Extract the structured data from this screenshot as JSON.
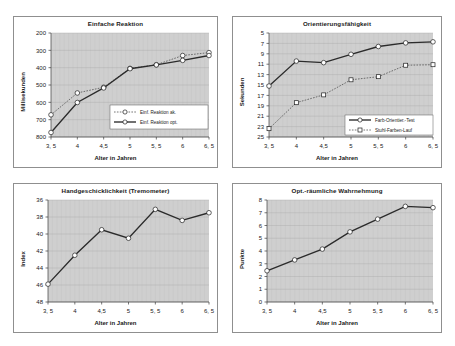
{
  "page": {
    "background_color": "#ffffff",
    "frame_color": "#8f8f8f",
    "plot_background_color": "#cfcfcf"
  },
  "shared": {
    "xlabel": "Alter in Jahren",
    "x_tick_labels": [
      "3, 5",
      "4",
      "4,5",
      "5",
      "5, 5",
      "6",
      "6, 5"
    ],
    "x_values": [
      3.5,
      4,
      4.5,
      5,
      5.5,
      6,
      6.5
    ]
  },
  "chart_data": [
    {
      "id": "einfache-reaktion",
      "type": "line",
      "title": "Einfache Reaktion",
      "xlabel": "Alter in Jahren",
      "ylabel": "Millisekunden",
      "x": [
        3.5,
        4,
        4.5,
        5,
        5.5,
        6,
        6.5
      ],
      "x_tick_labels": [
        "3, 5",
        "4",
        "4,5",
        "5",
        "5, 5",
        "6",
        "6, 5"
      ],
      "y_ticks": [
        200,
        300,
        400,
        500,
        600,
        700,
        800
      ],
      "ylim": [
        200,
        800
      ],
      "y_inverted": true,
      "grid": true,
      "legend_position": "lower right",
      "series": [
        {
          "name": "Einf. Reaktion ak.",
          "style": "dashed",
          "marker": "circle",
          "values": [
            672,
            546,
            513,
            404,
            383,
            330,
            313
          ]
        },
        {
          "name": "Einf. Reaktion opt.",
          "style": "solid",
          "marker": "circle",
          "values": [
            774,
            601,
            517,
            406,
            384,
            358,
            330
          ]
        }
      ]
    },
    {
      "id": "orientierungsfaehigkeit",
      "type": "line",
      "title": "Orientierungsfähigkeit",
      "xlabel": "Alter in Jahren",
      "ylabel": "Sekunden",
      "x": [
        3.5,
        4,
        4.5,
        5,
        5.5,
        6,
        6.5
      ],
      "x_tick_labels": [
        "3, 5",
        "4",
        "4,5",
        "5",
        "5, 5",
        "6",
        "6, 5"
      ],
      "y_ticks": [
        5,
        7,
        9,
        11,
        13,
        15,
        17,
        19,
        21,
        23,
        25
      ],
      "ylim": [
        5,
        25
      ],
      "y_inverted": true,
      "grid": true,
      "legend_position": "lower right",
      "series": [
        {
          "name": "Farb-Orientier.-Test",
          "style": "solid",
          "marker": "circle",
          "values": [
            15.2,
            10.4,
            10.7,
            9.1,
            7.6,
            6.9,
            6.7
          ]
        },
        {
          "name": "Stuhl-Farben-Lauf",
          "style": "dashed",
          "marker": "square",
          "values": [
            23.4,
            18.4,
            16.9,
            14.0,
            13.4,
            11.2,
            11.1
          ]
        }
      ]
    },
    {
      "id": "handgeschicklichkeit",
      "type": "line",
      "title": "Handgeschicklichkeit (Tremometer)",
      "xlabel": "Alter in Jahren",
      "ylabel": "Index",
      "x": [
        3.5,
        4,
        4.5,
        5,
        5.5,
        6,
        6.5
      ],
      "x_tick_labels": [
        "3, 5",
        "4",
        "4,5",
        "5",
        "5, 5",
        "6",
        "6, 5"
      ],
      "y_ticks": [
        36,
        38,
        40,
        42,
        44,
        46,
        48
      ],
      "ylim": [
        36,
        48
      ],
      "y_inverted": true,
      "grid": true,
      "legend_position": "none",
      "series": [
        {
          "name": "Index",
          "style": "solid",
          "marker": "circle",
          "values": [
            45.9,
            42.5,
            39.5,
            40.5,
            37.1,
            38.4,
            37.5
          ]
        }
      ]
    },
    {
      "id": "opt-raeumliche-wahrnehmung",
      "type": "line",
      "title": "Opt.-räumliche Wahrnehmung",
      "xlabel": "Alter in Jahren",
      "ylabel": "Punkte",
      "x": [
        3.5,
        4,
        4.5,
        5,
        5.5,
        6,
        6.5
      ],
      "x_tick_labels": [
        "3, 5",
        "4",
        "4,5",
        "5",
        "5, 5",
        "6",
        "6, 5"
      ],
      "y_ticks": [
        0,
        1,
        2,
        3,
        4,
        5,
        6,
        7,
        8
      ],
      "ylim": [
        0,
        8
      ],
      "y_inverted": false,
      "grid": true,
      "legend_position": "none",
      "series": [
        {
          "name": "Punkte",
          "style": "solid",
          "marker": "circle",
          "values": [
            2.45,
            3.3,
            4.15,
            5.5,
            6.5,
            7.5,
            7.4
          ]
        }
      ]
    }
  ]
}
